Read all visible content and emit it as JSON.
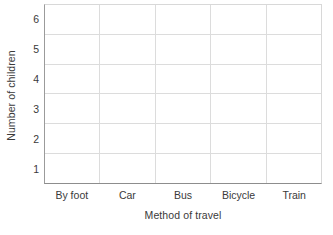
{
  "chart_data": {
    "type": "bar",
    "title": "",
    "subtitle": "",
    "xlabel": "Method of travel",
    "ylabel": "Number of children",
    "categories": [
      "By foot",
      "Car",
      "Bus",
      "Bicycle",
      "Train"
    ],
    "values": [
      0,
      0,
      0,
      0,
      0
    ],
    "series": [
      {
        "name": "Number of children",
        "values": [
          0,
          0,
          0,
          0,
          0
        ]
      }
    ],
    "y_ticks": [
      6,
      5,
      4,
      3,
      2,
      1
    ],
    "ylim": [
      0,
      6
    ],
    "grid": true,
    "legend": false,
    "legend_position": "none",
    "annotations": [],
    "note": "empty grid template - no bars drawn",
    "colors": {
      "text": "#3a3a3a",
      "gridline": "#dcdcdc",
      "axis": "#8d8d8d",
      "plot_background": "#ffffff",
      "page_background": "#ffffff"
    }
  }
}
